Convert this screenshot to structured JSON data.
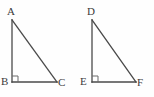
{
  "figure": {
    "type": "geometry-diagram",
    "background_color": "#fefefe",
    "stroke_color": "#4a4a4a",
    "label_color": "#3b3b3b",
    "stroke_width": 1.3,
    "shapes": [
      {
        "name": "triangle-abc",
        "vertices": [
          {
            "label": "A",
            "x": 12,
            "y": 20,
            "label_x": 7,
            "label_y": 6
          },
          {
            "label": "B",
            "x": 12,
            "y": 82,
            "label_x": 1,
            "label_y": 76,
            "right_angle": true
          },
          {
            "label": "C",
            "x": 57,
            "y": 82,
            "label_x": 58,
            "label_y": 77
          }
        ],
        "right_angle_marker": {
          "x": 12,
          "y": 76,
          "size": 6
        }
      },
      {
        "name": "triangle-def",
        "vertices": [
          {
            "label": "D",
            "x": 92,
            "y": 20,
            "label_x": 87,
            "label_y": 6
          },
          {
            "label": "E",
            "x": 92,
            "y": 82,
            "label_x": 80,
            "label_y": 76,
            "right_angle": true
          },
          {
            "label": "F",
            "x": 136,
            "y": 82,
            "label_x": 137,
            "label_y": 77
          }
        ],
        "right_angle_marker": {
          "x": 92,
          "y": 76,
          "size": 6
        }
      }
    ]
  }
}
